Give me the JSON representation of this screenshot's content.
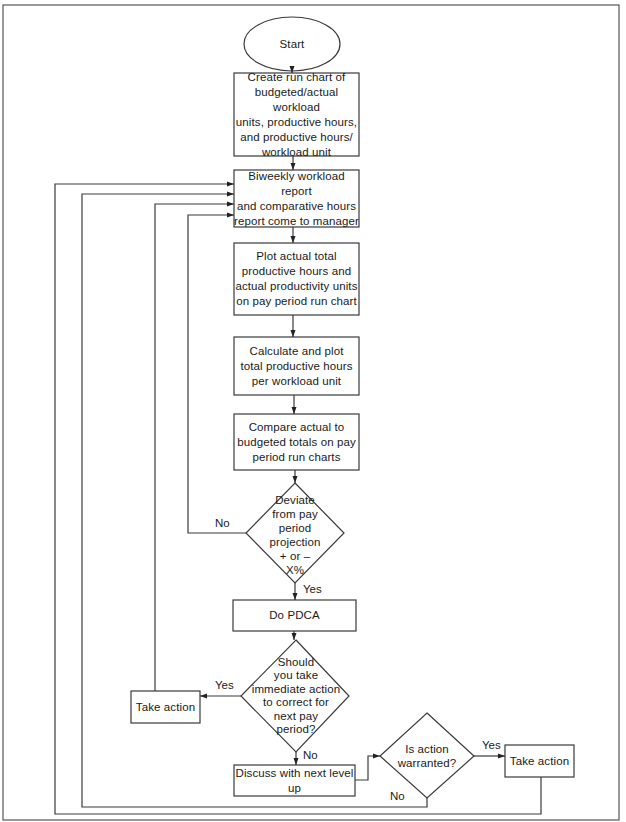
{
  "diagram": {
    "type": "flowchart",
    "nodes": {
      "start": {
        "shape": "ellipse",
        "text": "Start"
      },
      "create_chart": {
        "shape": "process",
        "text": "Create run chart of\nbudgeted/actual workload\nunits, productive hours,\nand productive hours/\nworkload unit"
      },
      "biweekly_report": {
        "shape": "process",
        "text": "Biweekly workload report\nand comparative hours\nreport come to manager"
      },
      "plot_actual": {
        "shape": "process",
        "text": "Plot actual total\nproductive hours and\nactual productivity units\non pay period run chart"
      },
      "calculate_plot": {
        "shape": "process",
        "text": "Calculate and plot\ntotal productive hours\nper workload unit"
      },
      "compare_actual": {
        "shape": "process",
        "text": "Compare actual to\nbudgeted totals on pay\nperiod run charts"
      },
      "deviate_decision": {
        "shape": "decision",
        "text": "Deviate\nfrom pay period\nprojection\n+ or –\nX%"
      },
      "do_pdca": {
        "shape": "process",
        "text": "Do PDCA"
      },
      "immediate_action_decision": {
        "shape": "decision",
        "text": "Should\nyou take\nimmediate action\nto correct for\nnext pay\nperiod?"
      },
      "take_action_left": {
        "shape": "process",
        "text": "Take action"
      },
      "discuss_next_level": {
        "shape": "process",
        "text": "Discuss with next level up"
      },
      "action_warranted_decision": {
        "shape": "decision",
        "text": "Is action\nwarranted?"
      },
      "take_action_right": {
        "shape": "process",
        "text": "Take action"
      }
    },
    "edge_labels": {
      "deviate_no": "No",
      "deviate_yes": "Yes",
      "immediate_yes": "Yes",
      "immediate_no": "No",
      "warranted_yes": "Yes",
      "warranted_no": "No"
    },
    "edges": [
      {
        "from": "start",
        "to": "create_chart"
      },
      {
        "from": "create_chart",
        "to": "biweekly_report"
      },
      {
        "from": "biweekly_report",
        "to": "plot_actual"
      },
      {
        "from": "plot_actual",
        "to": "calculate_plot"
      },
      {
        "from": "calculate_plot",
        "to": "compare_actual"
      },
      {
        "from": "compare_actual",
        "to": "deviate_decision"
      },
      {
        "from": "deviate_decision",
        "to": "biweekly_report",
        "label": "No"
      },
      {
        "from": "deviate_decision",
        "to": "do_pdca",
        "label": "Yes"
      },
      {
        "from": "do_pdca",
        "to": "immediate_action_decision"
      },
      {
        "from": "immediate_action_decision",
        "to": "take_action_left",
        "label": "Yes"
      },
      {
        "from": "take_action_left",
        "to": "biweekly_report"
      },
      {
        "from": "immediate_action_decision",
        "to": "discuss_next_level",
        "label": "No"
      },
      {
        "from": "discuss_next_level",
        "to": "action_warranted_decision"
      },
      {
        "from": "action_warranted_decision",
        "to": "take_action_right",
        "label": "Yes"
      },
      {
        "from": "action_warranted_decision",
        "to": "biweekly_report",
        "label": "No"
      },
      {
        "from": "take_action_right",
        "to": "biweekly_report"
      }
    ],
    "colors": {
      "stroke": "#3a3a3a",
      "text": "#1a1a1a",
      "background": "#ffffff"
    }
  }
}
